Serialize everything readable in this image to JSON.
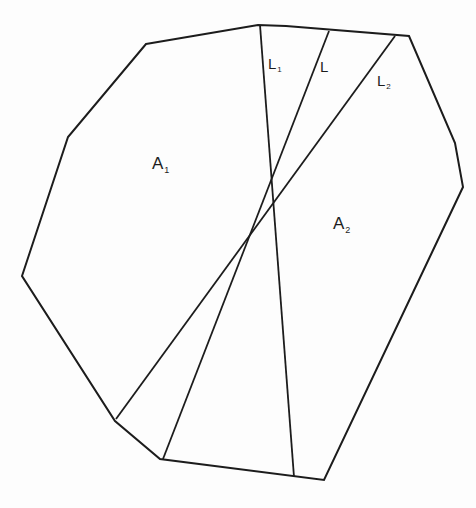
{
  "diagram": {
    "type": "polygon-partition",
    "polygon": {
      "stroke_color": "#1c1c1c",
      "vertices": [
        [
          146,
          44
        ],
        [
          258,
          25
        ],
        [
          286,
          26
        ],
        [
          409,
          36
        ],
        [
          455,
          143
        ],
        [
          463,
          187
        ],
        [
          324,
          480
        ],
        [
          160,
          459
        ],
        [
          115,
          421
        ],
        [
          22,
          276
        ],
        [
          68,
          137
        ]
      ]
    },
    "lines": [
      {
        "id": "L1",
        "label_main": "L",
        "label_sub": "1",
        "from": [
          260,
          25
        ],
        "to": [
          294,
          477
        ]
      },
      {
        "id": "L",
        "label_main": "L",
        "label_sub": "",
        "from": [
          329,
          31
        ],
        "to": [
          163,
          459
        ]
      },
      {
        "id": "L2",
        "label_main": "L",
        "label_sub": "2",
        "from": [
          395,
          36
        ],
        "to": [
          116,
          419
        ]
      }
    ],
    "regions": [
      {
        "id": "A1",
        "label_main": "A",
        "label_sub": "1"
      },
      {
        "id": "A2",
        "label_main": "A",
        "label_sub": "2"
      }
    ]
  }
}
